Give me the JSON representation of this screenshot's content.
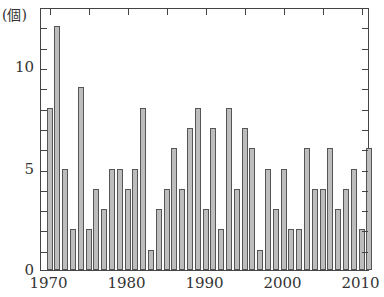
{
  "chart_data": {
    "type": "bar",
    "title": "",
    "xlabel": "",
    "ylabel": "(個)",
    "ylim": [
      0,
      13
    ],
    "grid": false,
    "legend": null,
    "categories": [
      1970,
      1971,
      1972,
      1973,
      1974,
      1975,
      1976,
      1977,
      1978,
      1979,
      1980,
      1981,
      1982,
      1983,
      1984,
      1985,
      1986,
      1987,
      1988,
      1989,
      1990,
      1991,
      1992,
      1993,
      1994,
      1995,
      1996,
      1997,
      1998,
      1999,
      2000,
      2001,
      2002,
      2003,
      2004,
      2005,
      2006,
      2007,
      2008,
      2009,
      2010,
      2011
    ],
    "values": [
      8,
      12,
      5,
      2,
      9,
      2,
      4,
      3,
      5,
      5,
      4,
      5,
      8,
      1,
      3,
      4,
      6,
      4,
      7,
      8,
      3,
      7,
      2,
      8,
      4,
      7,
      6,
      1,
      5,
      3,
      5,
      2,
      2,
      6,
      4,
      4,
      6,
      3,
      4,
      5,
      2,
      6
    ],
    "y_ticks": [
      "0",
      "5",
      "10"
    ],
    "x_ticks": [
      "1970",
      "1980",
      "1990",
      "2000",
      "2010"
    ],
    "bar_color": "#bdbdbd"
  },
  "labels": {
    "unit": "(個)"
  }
}
